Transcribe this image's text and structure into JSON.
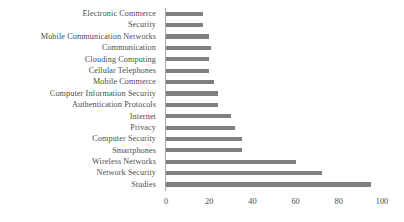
{
  "chart_data": {
    "type": "bar",
    "orientation": "horizontal",
    "title": "",
    "subtitle": "",
    "xlabel": "",
    "ylabel": "",
    "xlim": [
      0,
      100
    ],
    "xticks": [
      0,
      20,
      40,
      60,
      80,
      100
    ],
    "xtick_labels": [
      "0",
      "20",
      "40",
      "60",
      "80",
      "100"
    ],
    "grid": false,
    "legend": false,
    "legend_position": "none",
    "bar_color": "#808080",
    "axis_color": "#a6a6a6",
    "text_color": "#4d4d4d",
    "categories": [
      "Electronic Commerce",
      "Security",
      "Mobile Communication Networks",
      "Communication",
      "Clouding Computing",
      "Cellular Telephones",
      "Mobile Commerce",
      "Computer Information Security",
      "Authentication Protocols",
      "Internet",
      "Privacy",
      "Computer Security",
      "Smartphones",
      "Wireless Networks",
      "Network Security",
      "Studies"
    ],
    "values": [
      17,
      17,
      20,
      21,
      20,
      20,
      22,
      24,
      24,
      30,
      32,
      35,
      35,
      60,
      72,
      95
    ]
  }
}
